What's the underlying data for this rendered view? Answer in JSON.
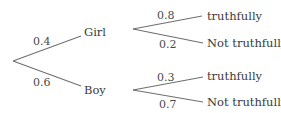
{
  "diagram": {
    "type": "probability-tree",
    "root": {
      "branches": [
        {
          "label": "Girl",
          "probability": "0.4",
          "outcomes": [
            {
              "label": "truthfully",
              "probability": "0.8"
            },
            {
              "label": "Not truthfully",
              "probability": "0.2"
            }
          ]
        },
        {
          "label": "Boy",
          "probability": "0.6",
          "outcomes": [
            {
              "label": "truthfully",
              "probability": "0.3"
            },
            {
              "label": "Not truthfully",
              "probability": "0.7"
            }
          ]
        }
      ]
    },
    "colors": {
      "line": "#6f6f6f",
      "text": "#3a3a3a"
    }
  }
}
